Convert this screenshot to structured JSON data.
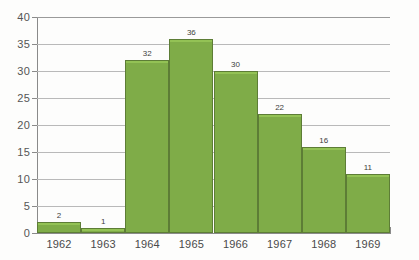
{
  "chart_data": {
    "type": "bar",
    "title": "",
    "subtitle": "",
    "xlabel": "",
    "ylabel": "",
    "categories": [
      "1962",
      "1963",
      "1964",
      "1965",
      "1966",
      "1967",
      "1968",
      "1969"
    ],
    "values": [
      2,
      1,
      32,
      36,
      30,
      22,
      16,
      11
    ],
    "value_labels": [
      "2",
      "1",
      "32",
      "36",
      "30",
      "22",
      "16",
      "11"
    ],
    "ylim": [
      0,
      40
    ],
    "ytick_labels": [
      "0",
      "5",
      "10",
      "15",
      "20",
      "25",
      "30",
      "35",
      "40"
    ],
    "ytick_values": [
      0,
      5,
      10,
      15,
      20,
      25,
      30,
      35,
      40
    ],
    "grid": true,
    "grid_axis": "y",
    "legend": false,
    "legend_position": "none",
    "bar_color": "#7fac48",
    "bar_edge_color": "#5d7d36",
    "bar_highlight_color": "#93c255",
    "grid_color": "#b9b9b9",
    "axis_color": "#8a8a8a",
    "text_color": "#4a4a4a",
    "background_color": "#fdfdfc"
  }
}
